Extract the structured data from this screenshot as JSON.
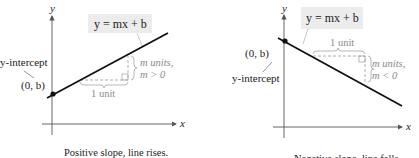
{
  "left_panel": {
    "axis_x_label": "x",
    "axis_y_label": "y",
    "equation": "y = mx + b",
    "intercept_label": "y-intercept",
    "point_label": "(0, b)",
    "run_label": "1 unit",
    "rise_label_1": "m units,",
    "rise_label_2": "m > 0",
    "caption": "Positive slope, line rises."
  },
  "right_panel": {
    "axis_x_label": "x",
    "axis_y_label": "y",
    "equation": "y = mx + b",
    "intercept_label": "y-intercept",
    "point_label": "(0, b)",
    "run_label": "1 unit",
    "rise_label_1": "m units,",
    "rise_label_2": "m < 0",
    "caption": "Negative slope, line falls."
  },
  "colors": {
    "line": "#111111",
    "axis": "#555555",
    "annotation": "#9a9a9a",
    "equation_box": "#ececec"
  }
}
